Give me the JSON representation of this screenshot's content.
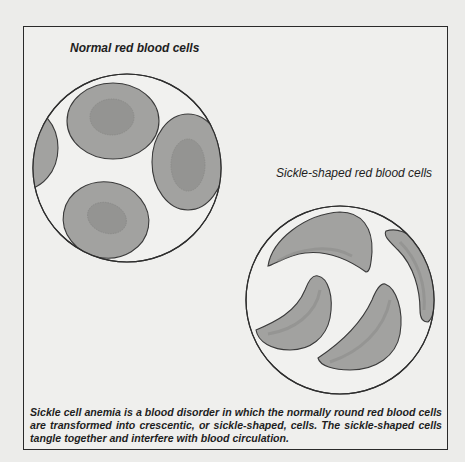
{
  "figure": {
    "labels": {
      "normal": "Normal red blood cells",
      "sickle": "Sickle-shaped red blood cells"
    },
    "caption": "Sickle cell anemia is a blood disorder in which the normally round red blood cells are transformed into crescentic, or sickle-shaped, cells. The sickle-shaped cells tangle together and interfere with blood circulation.",
    "colors": {
      "cell_fill": "#9d9d9b",
      "nucleus_fill": "#8e8e8c",
      "outline": "#3a3a3a",
      "background": "#efefed"
    }
  }
}
